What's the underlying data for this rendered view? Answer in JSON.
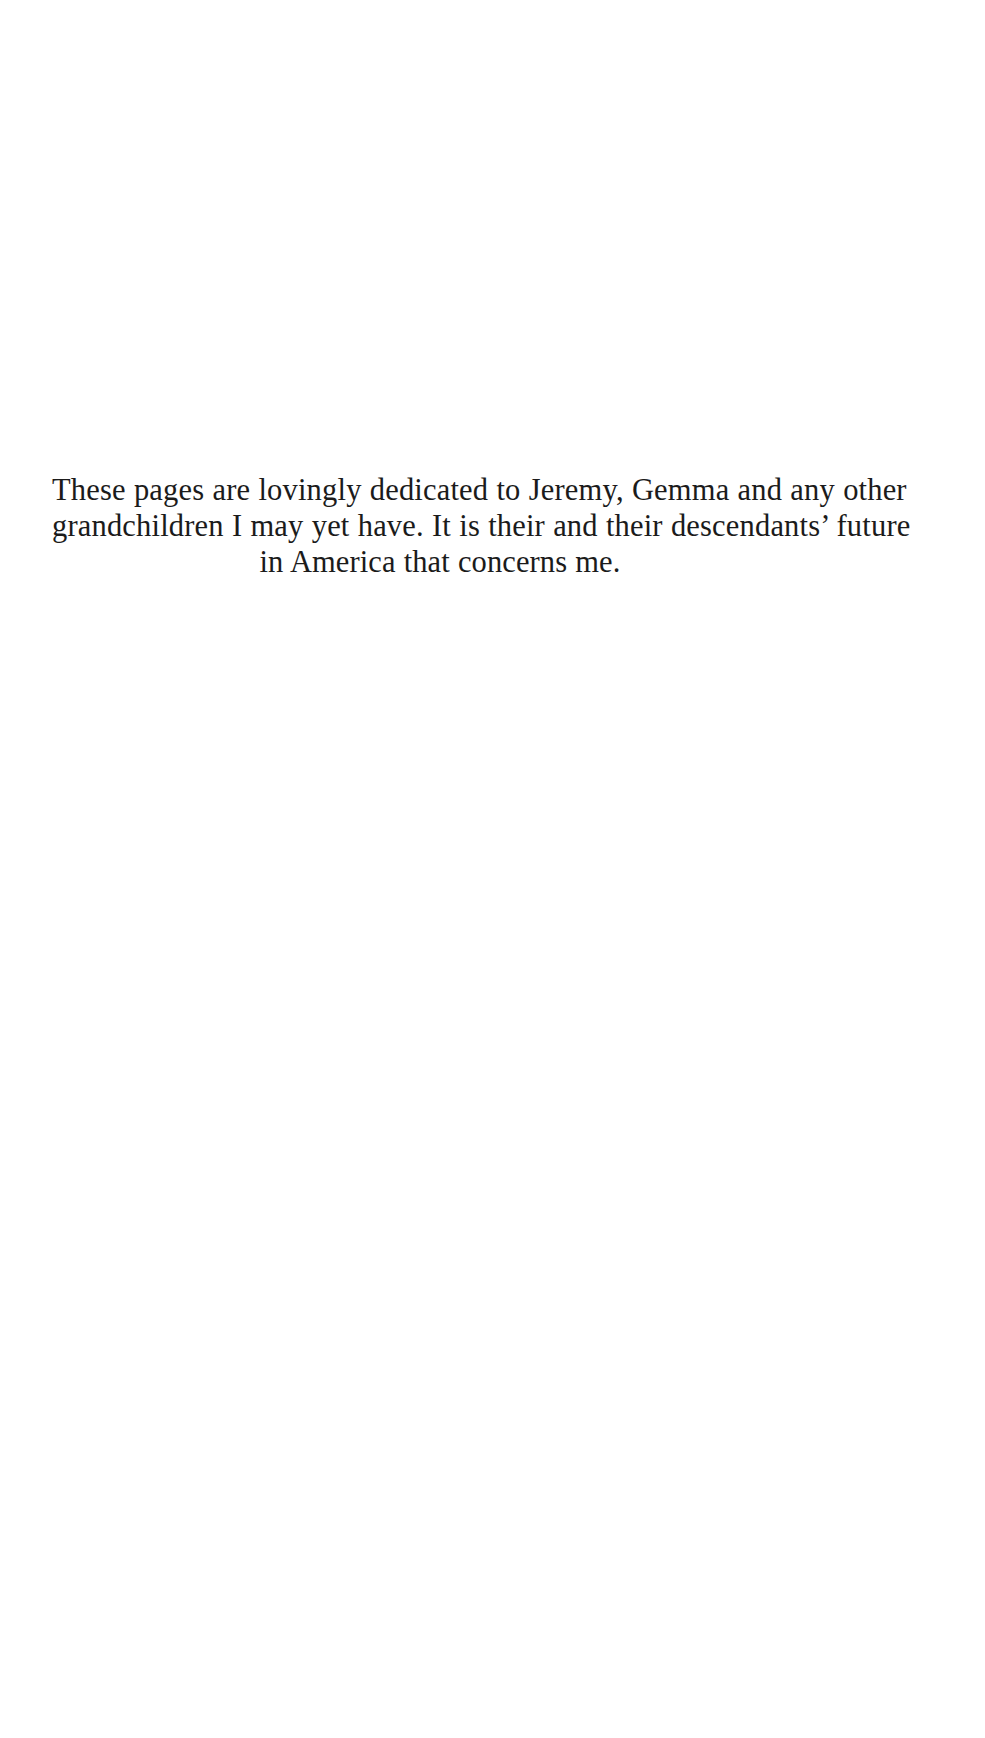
{
  "document": {
    "type": "book-dedication-page",
    "page_background_color": "#ffffff",
    "text_color": "#1b1b1b"
  },
  "dedication": {
    "lines": [
      "These pages are lovingly dedicated to Jeremy, Gemma and any other",
      "grandchildren I may yet have. It is their and their descendants’ future",
      "in America that concerns me."
    ],
    "full_text": "These pages are lovingly dedicated to Jeremy, Gemma and any other grandchildren I may yet have. It is their and their descendants’ future in America that concerns me.",
    "alignment": "center",
    "names_mentioned": [
      "Jeremy",
      "Gemma"
    ],
    "place_mentioned": "America"
  }
}
